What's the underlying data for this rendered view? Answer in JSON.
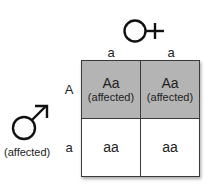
{
  "female": {
    "symbol": "female-symbol",
    "alleles": [
      "a",
      "a"
    ]
  },
  "male": {
    "symbol": "male-symbol",
    "phenotype": "(affected)",
    "alleles": [
      "A",
      "a"
    ]
  },
  "grid": {
    "rows": [
      [
        {
          "genotype": "Aa",
          "phenotype": "(affected)",
          "shaded": true
        },
        {
          "genotype": "Aa",
          "phenotype": "(affected)",
          "shaded": true
        }
      ],
      [
        {
          "genotype": "aa",
          "phenotype": "",
          "shaded": false
        },
        {
          "genotype": "aa",
          "phenotype": "",
          "shaded": false
        }
      ]
    ]
  },
  "colors": {
    "affected_fill": "#b4b4b4",
    "unaffected_fill": "#ffffff",
    "border": "#3a3a3a"
  }
}
